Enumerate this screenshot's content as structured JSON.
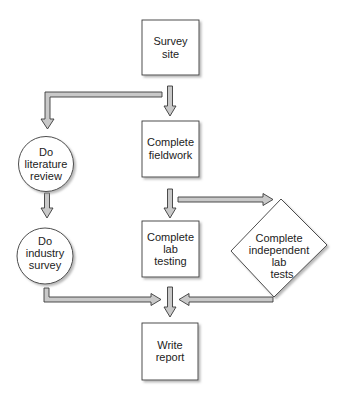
{
  "diagram": {
    "type": "flowchart",
    "colors": {
      "stroke": "#3a3a3a",
      "arrow_fill": "#c9c9c9",
      "node_fill": "#ffffff",
      "shadow": "#bdbdbd"
    },
    "nodes": [
      {
        "id": "survey-site",
        "shape": "rectangle",
        "lines": [
          "Survey",
          "site"
        ]
      },
      {
        "id": "complete-fieldwork",
        "shape": "rectangle",
        "lines": [
          "Complete",
          "fieldwork"
        ]
      },
      {
        "id": "do-literature-review",
        "shape": "circle",
        "lines": [
          "Do",
          "literature",
          "review"
        ]
      },
      {
        "id": "do-industry-survey",
        "shape": "circle",
        "lines": [
          "Do",
          "industry",
          "survey"
        ]
      },
      {
        "id": "complete-lab-testing",
        "shape": "rectangle",
        "lines": [
          "Complete",
          "lab",
          "testing"
        ]
      },
      {
        "id": "complete-independent-lab-tests",
        "shape": "diamond",
        "lines": [
          "Complete",
          "independent",
          "lab",
          "tests"
        ]
      },
      {
        "id": "write-report",
        "shape": "rectangle",
        "lines": [
          "Write",
          "report"
        ]
      }
    ],
    "edges": [
      {
        "from": "survey-site",
        "to": "complete-fieldwork"
      },
      {
        "from": "survey-site",
        "to": "do-literature-review"
      },
      {
        "from": "do-literature-review",
        "to": "do-industry-survey"
      },
      {
        "from": "complete-fieldwork",
        "to": "complete-lab-testing"
      },
      {
        "from": "complete-fieldwork",
        "to": "complete-independent-lab-tests"
      },
      {
        "from": "do-industry-survey",
        "to": "write-report"
      },
      {
        "from": "complete-lab-testing",
        "to": "write-report"
      },
      {
        "from": "complete-independent-lab-tests",
        "to": "write-report"
      }
    ]
  }
}
